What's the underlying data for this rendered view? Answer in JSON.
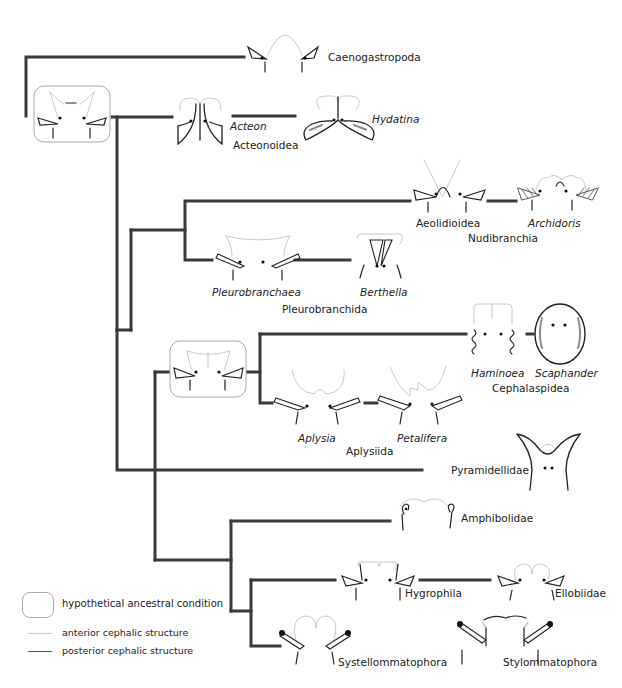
{
  "colors": {
    "branch": "#3a3a3a",
    "anterior": "#c8c8c8",
    "posterior": "#222222",
    "box_border": "#aaaaaa"
  },
  "taxa": {
    "caenogastropoda": "Caenogastropoda",
    "acteon": "Acteon",
    "hydatina": "Hydatina",
    "acteonoidea": "Acteonoidea",
    "aeolidioidea": "Aeolidioidea",
    "archidoris": "Archidoris",
    "nudibranchia": "Nudibranchia",
    "pleurobranchaea": "Pleurobranchaea",
    "berthella": "Berthella",
    "pleurobranchida": "Pleurobranchida",
    "haminoea": "Haminoea",
    "scaphander": "Scaphander",
    "cephalaspidea": "Cephalaspidea",
    "aplysia": "Aplysia",
    "petalifera": "Petalifera",
    "aplysiida": "Aplysiida",
    "pyramidellidae": "Pyramidellidae",
    "amphibolidae": "Amphibolidae",
    "hygrophila": "Hygrophila",
    "ellobiidae": "Ellobiidae",
    "systellommatophora": "Systellommatophora",
    "stylommatophora": "Stylommatophora"
  },
  "legend": {
    "ancestral": "hypothetical ancestral condition",
    "anterior": "anterior cephalic structure",
    "posterior": "posterior cephalic structure"
  }
}
